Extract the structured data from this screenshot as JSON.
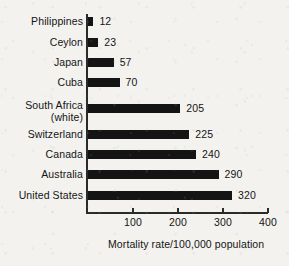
{
  "chart_data": {
    "type": "bar",
    "orientation": "horizontal",
    "title": "",
    "xlabel": "Mortality rate/100,000 population",
    "ylabel": "",
    "xlim": [
      0,
      400
    ],
    "xticks": [
      100,
      200,
      300,
      400
    ],
    "grid": false,
    "legend": null,
    "categories": [
      "Philippines",
      "Ceylon",
      "Japan",
      "Cuba",
      "South Africa (white)",
      "Switzerland",
      "Canada",
      "Australia",
      "United States"
    ],
    "values": [
      12,
      23,
      57,
      70,
      205,
      225,
      240,
      290,
      320
    ],
    "bars": [
      {
        "category_line1": "Philippines",
        "category_line2": "",
        "value": 12,
        "value_label": "12"
      },
      {
        "category_line1": "Ceylon",
        "category_line2": "",
        "value": 23,
        "value_label": "23"
      },
      {
        "category_line1": "Japan",
        "category_line2": "",
        "value": 57,
        "value_label": "57"
      },
      {
        "category_line1": "Cuba",
        "category_line2": "",
        "value": 70,
        "value_label": "70"
      },
      {
        "category_line1": "South Africa",
        "category_line2": "(white)",
        "value": 205,
        "value_label": "205"
      },
      {
        "category_line1": "Switzerland",
        "category_line2": "",
        "value": 225,
        "value_label": "225"
      },
      {
        "category_line1": "Canada",
        "category_line2": "",
        "value": 240,
        "value_label": "240"
      },
      {
        "category_line1": "Australia",
        "category_line2": "",
        "value": 290,
        "value_label": "290"
      },
      {
        "category_line1": "United States",
        "category_line2": "",
        "value": 320,
        "value_label": "320"
      }
    ],
    "tick_labels": [
      "100",
      "200",
      "300",
      "400"
    ],
    "colors": {
      "bar": "#141414",
      "axis": "#2a2a2a",
      "text": "#141414",
      "background": "#f3f2ef"
    }
  }
}
